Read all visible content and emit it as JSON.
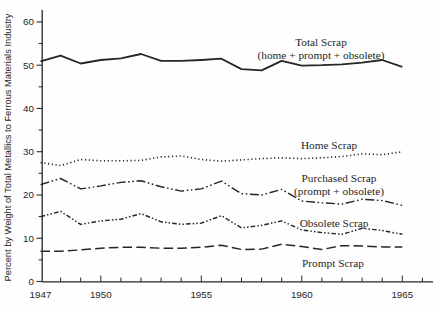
{
  "figure": {
    "background": "#fefefe",
    "ink": "#262626"
  },
  "y_axis": {
    "title": "Percent by Weight of Total Metallics to Ferrous Materials Industry",
    "major_ticks": [
      0,
      10,
      20,
      30,
      40,
      50,
      60
    ],
    "minor_ticks": [
      5,
      15,
      25,
      35,
      45,
      55
    ],
    "range": [
      0,
      62
    ]
  },
  "x_axis": {
    "labeled_ticks": [
      1947,
      1950,
      1955,
      1960,
      1965
    ],
    "minor_tick_start": 1948,
    "minor_tick_end": 1966,
    "range": [
      1947,
      1966.5
    ]
  },
  "chart_data": {
    "type": "line",
    "title": "",
    "xlabel": "",
    "ylabel": "Percent by Weight of Total Metallics to Ferrous Materials Industry",
    "ylim": [
      0,
      62
    ],
    "xlim": [
      1947,
      1966.5
    ],
    "grid": false,
    "legend_position": "inline-annotations",
    "x": [
      1947,
      1948,
      1949,
      1950,
      1951,
      1952,
      1953,
      1954,
      1955,
      1956,
      1957,
      1958,
      1959,
      1960,
      1961,
      1962,
      1963,
      1964,
      1965
    ],
    "series": [
      {
        "name": "Total Scrap",
        "style": "solid",
        "values": [
          50.9,
          52.2,
          50.4,
          51.2,
          51.6,
          52.6,
          51.0,
          51.0,
          51.2,
          51.5,
          49.1,
          48.8,
          51.0,
          49.9,
          50.0,
          50.2,
          50.6,
          51.2,
          49.6
        ]
      },
      {
        "name": "Home Scrap",
        "style": "dotted",
        "values": [
          27.5,
          26.8,
          28.2,
          27.9,
          27.9,
          28.0,
          28.8,
          29.0,
          28.2,
          27.8,
          28.1,
          28.4,
          28.6,
          28.4,
          28.6,
          28.9,
          29.5,
          29.3,
          30.0
        ]
      },
      {
        "name": "Purchased Scrap",
        "style": "dash-dot-dot",
        "values": [
          22.4,
          23.8,
          21.4,
          22.1,
          22.9,
          23.3,
          21.9,
          20.9,
          21.4,
          23.2,
          20.3,
          20.0,
          21.3,
          18.6,
          18.2,
          17.9,
          19.0,
          18.7,
          17.6
        ]
      },
      {
        "name": "Obsolete Scrap",
        "style": "short-dash-dot-dot",
        "values": [
          15.0,
          16.2,
          13.2,
          14.0,
          14.4,
          15.7,
          13.8,
          13.2,
          13.5,
          15.2,
          12.4,
          13.0,
          14.0,
          11.9,
          11.3,
          10.9,
          12.3,
          11.8,
          10.9
        ]
      },
      {
        "name": "Prompt Scrap",
        "style": "dashed",
        "values": [
          7.0,
          7.0,
          7.3,
          7.7,
          7.9,
          7.9,
          7.7,
          7.7,
          7.9,
          8.4,
          7.4,
          7.5,
          8.6,
          8.1,
          7.4,
          8.3,
          8.2,
          8.0,
          8.0
        ]
      }
    ],
    "annotations": [
      {
        "id": "total-scrap",
        "lines": [
          "Total Scrap",
          "(home + prompt + obsolete)"
        ],
        "x": 321,
        "y": 46
      },
      {
        "id": "home-scrap",
        "lines": [
          "Home Scrap"
        ],
        "x": 329,
        "y": 149
      },
      {
        "id": "purchased-scrap",
        "lines": [
          "Purchased Scrap",
          "(prompt + obsolete)"
        ],
        "x": 339,
        "y": 182
      },
      {
        "id": "obsolete-scrap",
        "lines": [
          "Obsolete Scrap"
        ],
        "x": 334,
        "y": 227
      },
      {
        "id": "prompt-scrap",
        "lines": [
          "Prompt Scrap"
        ],
        "x": 333,
        "y": 267
      }
    ]
  }
}
